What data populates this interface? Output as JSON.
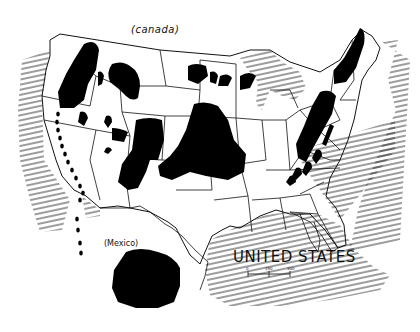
{
  "map": {
    "title": "UNITED STATES",
    "labels": {
      "north": "(canada)",
      "south": "(Mexico)"
    },
    "scale_bar": {
      "ticks": [
        "0",
        "150",
        "300"
      ]
    },
    "colors": {
      "background": "#ffffff",
      "ink": "#111111",
      "regions_fill": "#000000",
      "water_hatch": "#222222"
    },
    "legend": "Black regions mark highlighted areas; hatched lines mark ocean/lakes",
    "regions": [
      {
        "name": "northern-rockies-region"
      },
      {
        "name": "montana-region"
      },
      {
        "name": "idaho-cluster"
      },
      {
        "name": "nevada-clusters"
      },
      {
        "name": "utah-clusters"
      },
      {
        "name": "colorado-region"
      },
      {
        "name": "great-plains-region"
      },
      {
        "name": "upper-midwest-clusters"
      },
      {
        "name": "new-england-region"
      },
      {
        "name": "appalachian-region"
      },
      {
        "name": "southern-appalachian-clusters"
      },
      {
        "name": "pacific-coast-dots"
      },
      {
        "name": "mexico-region"
      }
    ]
  }
}
